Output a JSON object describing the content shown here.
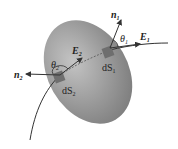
{
  "diagram": {
    "labels": {
      "n1": "n",
      "n1_sub": "1",
      "n2": "n",
      "n2_sub": "2",
      "E1": "E",
      "E1_sub": "1",
      "E2": "E",
      "E2_sub": "2",
      "theta1": "θ",
      "theta1_sub": "1",
      "theta2": "θ",
      "theta2_sub": "2",
      "dS1": "dS",
      "dS1_sub": "1",
      "dS2": "dS",
      "dS2_sub": "2"
    },
    "colors": {
      "surface": "#9a9a9a",
      "patch": "#6e6e6e",
      "line": "#333333"
    }
  }
}
